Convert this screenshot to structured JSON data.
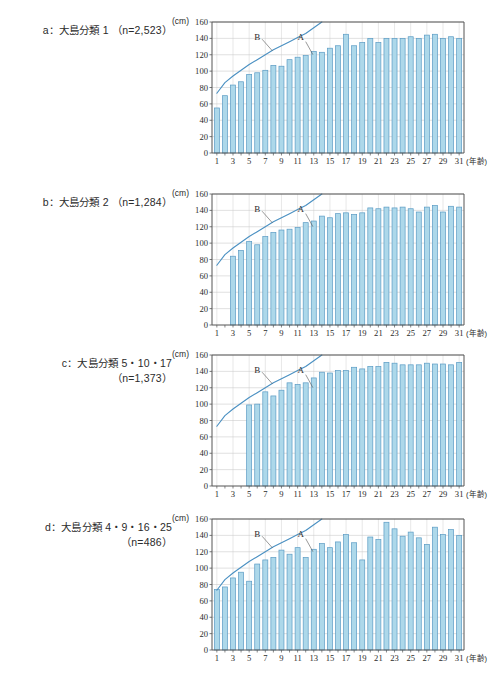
{
  "figure": {
    "unit_label": "(cm)",
    "x_axis_unit": "(年齢)",
    "y_ticks": [
      0,
      20,
      40,
      60,
      80,
      100,
      120,
      140,
      160
    ],
    "x_ticks": [
      1,
      3,
      5,
      7,
      9,
      11,
      13,
      15,
      17,
      19,
      21,
      23,
      25,
      27,
      29,
      31
    ],
    "colors": {
      "bar_fill": "#add8ea",
      "bar_stroke": "#5a9bc4",
      "line": "#4a90c2",
      "axis": "#555555",
      "grid": "#cccccc",
      "text": "#2b2b2b"
    },
    "series_labels": {
      "bars": "A",
      "line": "B"
    }
  },
  "panels": [
    {
      "id": "panel-a",
      "caption_line1": "a：大島分類 1 （n=2,523）",
      "caption_line2": "",
      "chart_data": {
        "type": "bar",
        "title": "a：大島分類 1 （n=2,523）",
        "xlabel": "(年齢)",
        "ylabel": "(cm)",
        "ylim": [
          0,
          160
        ],
        "xlim": [
          0.4,
          31.6
        ],
        "grid": true,
        "legend_position": "inline-annotation",
        "categories": [
          1,
          2,
          3,
          4,
          5,
          6,
          7,
          8,
          9,
          10,
          11,
          12,
          13,
          14,
          15,
          16,
          17,
          18,
          19,
          20,
          21,
          22,
          23,
          24,
          25,
          26,
          27,
          28,
          29,
          30,
          31
        ],
        "series": [
          {
            "name": "A",
            "type": "bar",
            "values": [
              55,
              70,
              83,
              87,
              96,
              98,
              101,
              107,
              106,
              114,
              117,
              119,
              124,
              123,
              128,
              131,
              145,
              131,
              135,
              140,
              135,
              140,
              140,
              140,
              142,
              140,
              144,
              145,
              140,
              142,
              140
            ]
          },
          {
            "name": "B",
            "type": "line",
            "values": [
              73,
              86,
              94,
              101,
              108,
              114,
              120,
              126,
              131,
              136,
              141,
              146,
              153,
              160,
              null,
              null,
              null,
              null,
              null,
              null,
              null,
              null,
              null,
              null,
              null,
              null,
              null,
              null,
              null,
              null,
              null
            ]
          }
        ]
      }
    },
    {
      "id": "panel-b",
      "caption_line1": "b：大島分類 2 （n=1,284）",
      "caption_line2": "",
      "chart_data": {
        "type": "bar",
        "title": "b：大島分類 2 （n=1,284）",
        "xlabel": "(年齢)",
        "ylabel": "(cm)",
        "ylim": [
          0,
          160
        ],
        "xlim": [
          0.4,
          31.6
        ],
        "grid": true,
        "legend_position": "inline-annotation",
        "categories": [
          1,
          2,
          3,
          4,
          5,
          6,
          7,
          8,
          9,
          10,
          11,
          12,
          13,
          14,
          15,
          16,
          17,
          18,
          19,
          20,
          21,
          22,
          23,
          24,
          25,
          26,
          27,
          28,
          29,
          30,
          31
        ],
        "series": [
          {
            "name": "A",
            "type": "bar",
            "values": [
              null,
              null,
              84,
              91,
              102,
              98,
              108,
              113,
              116,
              117,
              119,
              125,
              127,
              133,
              131,
              136,
              137,
              135,
              137,
              143,
              142,
              144,
              143,
              144,
              142,
              138,
              144,
              146,
              138,
              145,
              144,
              141
            ]
          },
          {
            "name": "B",
            "type": "line",
            "values": [
              73,
              86,
              94,
              101,
              108,
              114,
              120,
              126,
              131,
              136,
              141,
              146,
              153,
              160,
              null,
              null,
              null,
              null,
              null,
              null,
              null,
              null,
              null,
              null,
              null,
              null,
              null,
              null,
              null,
              null,
              null
            ]
          }
        ]
      }
    },
    {
      "id": "panel-c",
      "caption_line1": "c：大島分類 5・10・17",
      "caption_line2": "（n=1,373）",
      "chart_data": {
        "type": "bar",
        "title": "c：大島分類 5・10・17 （n=1,373）",
        "xlabel": "(年齢)",
        "ylabel": "(cm)",
        "ylim": [
          0,
          160
        ],
        "xlim": [
          0.4,
          31.6
        ],
        "grid": true,
        "legend_position": "inline-annotation",
        "categories": [
          1,
          2,
          3,
          4,
          5,
          6,
          7,
          8,
          9,
          10,
          11,
          12,
          13,
          14,
          15,
          16,
          17,
          18,
          19,
          20,
          21,
          22,
          23,
          24,
          25,
          26,
          27,
          28,
          29,
          30,
          31
        ],
        "series": [
          {
            "name": "A",
            "type": "bar",
            "values": [
              null,
              null,
              null,
              null,
              99,
              100,
              115,
              110,
              117,
              126,
              124,
              126,
              132,
              139,
              138,
              141,
              141,
              145,
              143,
              146,
              146,
              151,
              150,
              148,
              148,
              148,
              150,
              149,
              149,
              148,
              151,
              146
            ]
          },
          {
            "name": "B",
            "type": "line",
            "values": [
              73,
              86,
              94,
              101,
              108,
              114,
              120,
              126,
              131,
              136,
              141,
              146,
              153,
              160,
              null,
              null,
              null,
              null,
              null,
              null,
              null,
              null,
              null,
              null,
              null,
              null,
              null,
              null,
              null,
              null,
              null
            ]
          }
        ]
      }
    },
    {
      "id": "panel-d",
      "caption_line1": "d：大島分類 4・9・16・25",
      "caption_line2": "（n=486）",
      "chart_data": {
        "type": "bar",
        "title": "d：大島分類 4・9・16・25 （n=486）",
        "xlabel": "(年齢)",
        "ylabel": "(cm)",
        "ylim": [
          0,
          160
        ],
        "xlim": [
          0.4,
          31.6
        ],
        "grid": true,
        "legend_position": "inline-annotation",
        "categories": [
          1,
          2,
          3,
          4,
          5,
          6,
          7,
          8,
          9,
          10,
          11,
          12,
          13,
          14,
          15,
          16,
          17,
          18,
          19,
          20,
          21,
          22,
          23,
          24,
          25,
          26,
          27,
          28,
          29,
          30,
          31
        ],
        "series": [
          {
            "name": "A",
            "type": "bar",
            "values": [
              74,
              77,
              88,
              95,
              84,
              105,
              110,
              113,
              122,
              117,
              125,
              113,
              123,
              130,
              125,
              132,
              141,
              131,
              110,
              138,
              135,
              156,
              148,
              139,
              144,
              137,
              129,
              150,
              141,
              147,
              140
            ]
          },
          {
            "name": "B",
            "type": "line",
            "values": [
              73,
              86,
              94,
              101,
              108,
              114,
              120,
              126,
              131,
              136,
              141,
              146,
              153,
              160,
              null,
              null,
              null,
              null,
              null,
              null,
              null,
              null,
              null,
              null,
              null,
              null,
              null,
              null,
              null,
              null,
              null
            ]
          }
        ]
      }
    }
  ]
}
